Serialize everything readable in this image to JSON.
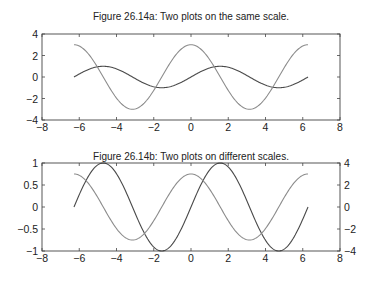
{
  "chart_data": [
    {
      "type": "line",
      "title": "Figure 26.14a: Two plots on the same scale.",
      "xlabel": "",
      "ylabel": "",
      "xlim": [
        -8,
        8
      ],
      "ylim": [
        -4,
        4
      ],
      "xticks": [
        -8,
        -6,
        -4,
        -2,
        0,
        2,
        4,
        6,
        8
      ],
      "yticks": [
        -4,
        -2,
        0,
        2,
        4
      ],
      "xtick_labels": [
        "−8",
        "−6",
        "−4",
        "−2",
        "0",
        "2",
        "4",
        "6",
        "8"
      ],
      "ytick_labels": [
        "−4",
        "−2",
        "0",
        "2",
        "4"
      ],
      "grid": false,
      "x_range": [
        -6.2832,
        6.2832
      ],
      "series": [
        {
          "name": "sin(x)",
          "function": "sin",
          "amplitude": 1,
          "color": "#4a4a4a"
        },
        {
          "name": "3cos(x)",
          "function": "cos",
          "amplitude": 3,
          "color": "#8c8c8c"
        }
      ]
    },
    {
      "type": "line",
      "title": "Figure 26.14b: Two plots on different scales.",
      "xlabel": "",
      "ylabel": "",
      "xlim": [
        -8,
        8
      ],
      "ylim": [
        -1,
        1
      ],
      "ylim_right": [
        -4,
        4
      ],
      "xticks": [
        -8,
        -6,
        -4,
        -2,
        0,
        2,
        4,
        6,
        8
      ],
      "yticks": [
        -1,
        -0.5,
        0,
        0.5,
        1
      ],
      "yticks_right": [
        -4,
        -2,
        0,
        2,
        4
      ],
      "xtick_labels": [
        "−8",
        "−6",
        "−4",
        "−2",
        "0",
        "2",
        "4",
        "6",
        "8"
      ],
      "ytick_labels": [
        "−1",
        "−0.5",
        "0",
        "0.5",
        "1"
      ],
      "ytick_labels_right": [
        "−4",
        "−2",
        "0",
        "2",
        "4"
      ],
      "grid": false,
      "x_range": [
        -6.2832,
        6.2832
      ],
      "series": [
        {
          "name": "sin(x)",
          "axis": "left",
          "function": "sin",
          "amplitude": 1,
          "color": "#4a4a4a"
        },
        {
          "name": "3cos(x)",
          "axis": "right",
          "function": "cos",
          "amplitude": 3,
          "color": "#8c8c8c"
        }
      ]
    }
  ]
}
